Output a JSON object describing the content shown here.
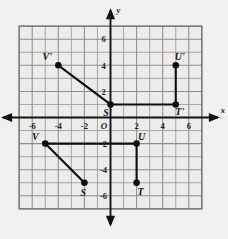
{
  "figure": {
    "type": "coordinate-plane",
    "origin_label": "O",
    "x_axis_label": "x",
    "y_axis_label": "y"
  },
  "chart_data": {
    "type": "scatter",
    "title": "",
    "xlabel": "x",
    "ylabel": "y",
    "xlim": [
      -7,
      7
    ],
    "ylim": [
      -7,
      7
    ],
    "grid": true,
    "legend": "none",
    "x_tick_labels": [
      "-6",
      "-4",
      "-2",
      "2",
      "4",
      "6"
    ],
    "x_tick_values": [
      -6,
      -4,
      -2,
      2,
      4,
      6
    ],
    "y_tick_labels": [
      "6",
      "4",
      "2",
      "-2",
      "-4",
      "-6"
    ],
    "y_tick_values": [
      6,
      4,
      2,
      -2,
      -4,
      -6
    ],
    "origin_label": "O",
    "series": [
      {
        "name": "Preimage SUTV",
        "points": [
          {
            "label": "S",
            "x": -2,
            "y": -5,
            "label_dx": -1,
            "label_dy": 13
          },
          {
            "label": "T",
            "x": 2,
            "y": -5,
            "label_dx": 4,
            "label_dy": 12
          },
          {
            "label": "U",
            "x": 2,
            "y": -2,
            "label_dx": 5,
            "label_dy": -4
          },
          {
            "label": "V",
            "x": -5,
            "y": -2,
            "label_dx": -10,
            "label_dy": -4
          }
        ],
        "segments": [
          {
            "from": "V",
            "to": "S"
          },
          {
            "from": "V",
            "to": "U"
          },
          {
            "from": "U",
            "to": "T"
          }
        ]
      },
      {
        "name": "Image S'U'T'V'",
        "points": [
          {
            "label": "S'",
            "x": 0,
            "y": 1,
            "label_dx": -3,
            "label_dy": 12
          },
          {
            "label": "T'",
            "x": 5,
            "y": 1,
            "label_dx": 4,
            "label_dy": 11
          },
          {
            "label": "U'",
            "x": 5,
            "y": 4,
            "label_dx": 4,
            "label_dy": -5
          },
          {
            "label": "V'",
            "x": -4,
            "y": 4,
            "label_dx": -11,
            "label_dy": -5
          }
        ],
        "segments": [
          {
            "from": "V'",
            "to": "S'"
          },
          {
            "from": "S'",
            "to": "T'"
          },
          {
            "from": "T'",
            "to": "U'"
          }
        ]
      }
    ]
  }
}
